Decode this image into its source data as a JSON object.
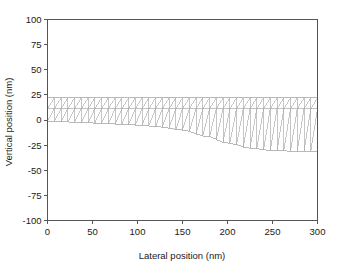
{
  "chart_data": {
    "type": "line",
    "title": "",
    "subtitle": "",
    "xlabel": "Lateral position (nm)",
    "ylabel": "Vertical position (nm)",
    "xlim": [
      0,
      300
    ],
    "ylim": [
      -100,
      100
    ],
    "xticks": [
      0,
      50,
      100,
      150,
      200,
      250,
      300
    ],
    "xtick_labels": [
      "0",
      "50",
      "100",
      "150",
      "200",
      "250",
      "300"
    ],
    "yticks": [
      -100,
      -75,
      -50,
      -25,
      0,
      25,
      50,
      75,
      100
    ],
    "ytick_labels": [
      "-100",
      "-75",
      "-50",
      "-25",
      "0",
      "25",
      "50",
      "75",
      "100"
    ],
    "grid": false,
    "legend": null,
    "legend_position": "none",
    "series": [
      {
        "name": "top-surface",
        "description": "Upper boundary of meshed film, flat at 22 nm",
        "x": [
          0,
          25,
          50,
          75,
          100,
          125,
          150,
          175,
          200,
          225,
          250,
          275,
          300
        ],
        "values": [
          22,
          22,
          22,
          22,
          22,
          22,
          22,
          22,
          22,
          22,
          22,
          22,
          22
        ]
      },
      {
        "name": "interface-layer",
        "description": "Internal horizontal interface line separating thin top layer from substrate mesh",
        "x": [
          0,
          25,
          50,
          75,
          100,
          125,
          150,
          175,
          200,
          225,
          250,
          275,
          300
        ],
        "values": [
          11,
          11,
          11,
          11,
          11,
          11,
          11,
          11,
          11,
          11,
          11,
          11,
          11
        ]
      },
      {
        "name": "bottom-surface",
        "description": "Lower boundary of mesh, dips from 0 nm to about -31 nm",
        "x": [
          0,
          25,
          50,
          75,
          100,
          125,
          150,
          175,
          200,
          225,
          250,
          275,
          300
        ],
        "values": [
          -1,
          -2,
          -3,
          -4,
          -5,
          -7,
          -10,
          -16,
          -23,
          -28,
          -30.5,
          -31,
          -31
        ]
      }
    ],
    "mesh": {
      "description": "Triangular finite-element mesh with two element rows: a thin uniform upper row and a lower row whose depth follows the dipping bottom surface",
      "columns": 40,
      "rows": 2,
      "line_color": "#a8a8a8"
    }
  },
  "style": {
    "axis_color": "#555555",
    "text_color": "#1a1a1a",
    "mesh_color": "#a8a8a8",
    "background": "#ffffff"
  }
}
